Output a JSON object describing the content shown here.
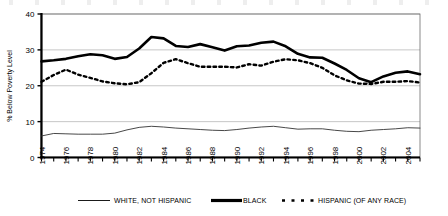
{
  "chart_data": {
    "type": "line",
    "title": "",
    "xlabel": "",
    "ylabel": "% Below Poverty Level",
    "ylim": [
      0,
      40
    ],
    "yticks": [
      0,
      10,
      20,
      30,
      40
    ],
    "ytick_labels": [
      "0",
      "10",
      "20",
      "30",
      "40"
    ],
    "grid": true,
    "grid_axis": "y",
    "legend_position": "bottom",
    "x": [
      1974,
      1975,
      1976,
      1977,
      1978,
      1979,
      1980,
      1981,
      1982,
      1983,
      1984,
      1985,
      1986,
      1987,
      1988,
      1989,
      1990,
      1991,
      1992,
      1993,
      1994,
      1995,
      1996,
      1997,
      1998,
      1999,
      2000,
      2001,
      2002,
      2003,
      2004,
      2005
    ],
    "xtick_labels": [
      "1974",
      "1976",
      "1978",
      "1980",
      "1982",
      "1984",
      "1986",
      "1988",
      "1990",
      "1992",
      "1994",
      "1996",
      "1998",
      "2000",
      "2002",
      "2004"
    ],
    "xlim": [
      1974,
      2005
    ],
    "series": [
      {
        "name": "WHITE, NOT HISPANIC",
        "style": "thin-solid",
        "color": "#333333",
        "values": [
          6.0,
          6.7,
          6.6,
          6.5,
          6.5,
          6.5,
          6.8,
          7.7,
          8.4,
          8.7,
          8.5,
          8.2,
          8.0,
          7.8,
          7.6,
          7.5,
          7.8,
          8.2,
          8.5,
          8.7,
          8.3,
          7.9,
          8.0,
          8.0,
          7.6,
          7.3,
          7.2,
          7.6,
          7.8,
          8.0,
          8.3,
          8.2
        ]
      },
      {
        "name": "BLACK",
        "style": "thick-solid",
        "color": "#000000",
        "values": [
          26.8,
          27.1,
          27.5,
          28.2,
          28.8,
          28.5,
          27.5,
          28.0,
          30.4,
          33.6,
          33.2,
          31.1,
          30.8,
          31.6,
          30.7,
          29.8,
          31.0,
          31.2,
          32.0,
          32.3,
          31.0,
          28.9,
          27.9,
          27.8,
          26.2,
          24.4,
          22.1,
          21.0,
          22.6,
          23.6,
          24.0,
          23.2
        ]
      },
      {
        "name": "HISPANIC (OF ANY RACE)",
        "style": "dotted",
        "color": "#000000",
        "values": [
          21.1,
          23.0,
          24.5,
          23.1,
          22.2,
          21.2,
          20.7,
          20.4,
          21.0,
          23.5,
          26.4,
          27.4,
          26.3,
          25.3,
          25.3,
          25.3,
          25.1,
          26.0,
          25.6,
          26.7,
          27.4,
          27.1,
          26.3,
          25.0,
          22.9,
          21.5,
          20.6,
          20.5,
          21.1,
          21.1,
          21.3,
          20.9
        ]
      }
    ]
  },
  "legend": {
    "items": [
      {
        "label": "WHITE, NOT HISPANIC",
        "marker": "thin-line-swatch"
      },
      {
        "label": "BLACK",
        "marker": "thick-line-swatch"
      },
      {
        "label": "HISPANIC (OF ANY RACE)",
        "marker": "dotted-line-swatch"
      }
    ]
  }
}
